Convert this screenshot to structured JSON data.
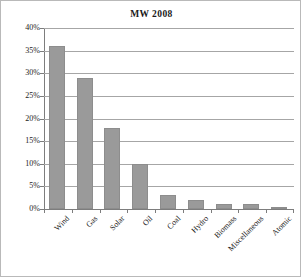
{
  "chart_data": {
    "type": "bar",
    "title": "MW 2008",
    "xlabel": "",
    "ylabel": "",
    "categories": [
      "Wind",
      "Gas",
      "Solar",
      "Oil",
      "Coal",
      "Hydro",
      "Biomass",
      "Miscellaneous",
      "Atomic"
    ],
    "values": [
      36,
      29,
      18,
      10,
      3,
      2,
      1,
      1,
      0.2
    ],
    "value_labels": [
      "36%",
      "29%",
      "18%",
      "10%",
      "3%",
      "2%",
      "1%",
      "1%",
      "0.2%"
    ],
    "ylim": [
      0,
      40
    ],
    "y_ticks": [
      0,
      5,
      10,
      15,
      20,
      25,
      30,
      35,
      40
    ],
    "y_tick_labels": [
      "0%",
      "5%",
      "10%",
      "15%",
      "20%",
      "25%",
      "30%",
      "35%",
      "40%"
    ],
    "grid": true,
    "legend": false,
    "legend_position": "none",
    "bar_color": "#9a9a9a",
    "gridline_color": "#a6a6a6",
    "axis_color": "#7d7d7d",
    "background_color": "#ffffff",
    "x_label_rotation": -45
  }
}
